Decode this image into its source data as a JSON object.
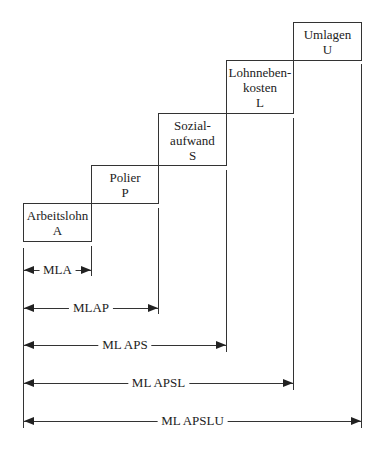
{
  "boxes": [
    {
      "id": "A",
      "lines": [
        "Arbeitslohn",
        "A"
      ]
    },
    {
      "id": "P",
      "lines": [
        "Polier",
        "P"
      ]
    },
    {
      "id": "S",
      "lines": [
        "Sozial-",
        "aufwand",
        "S"
      ]
    },
    {
      "id": "L",
      "lines": [
        "Lohnneben-",
        "kosten",
        "L"
      ]
    },
    {
      "id": "U",
      "lines": [
        "Umlagen",
        "U"
      ]
    }
  ],
  "dimensions": [
    {
      "label": "MLA"
    },
    {
      "label": "MLAP"
    },
    {
      "label": "ML APS"
    },
    {
      "label": "ML APSL"
    },
    {
      "label": "ML APSLU"
    }
  ],
  "colors": {
    "line": "#333333",
    "background": "#ffffff"
  }
}
